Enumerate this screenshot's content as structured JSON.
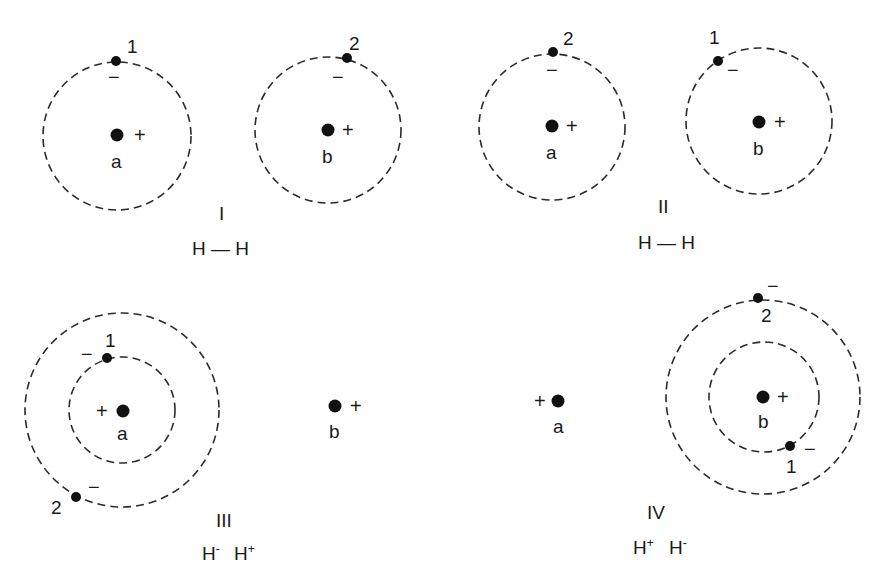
{
  "diagram": {
    "panels": [
      {
        "id": "I",
        "roman_label": "I",
        "formula": "H — H",
        "atoms": [
          {
            "label": "a",
            "charge": "+",
            "electron": {
              "number": "1",
              "charge": "−"
            }
          },
          {
            "label": "b",
            "charge": "+",
            "electron": {
              "number": "2",
              "charge": "−"
            }
          }
        ]
      },
      {
        "id": "II",
        "roman_label": "II",
        "formula": "H — H",
        "atoms": [
          {
            "label": "a",
            "charge": "+",
            "electron": {
              "number": "2",
              "charge": "−"
            }
          },
          {
            "label": "b",
            "charge": "+",
            "electron": {
              "number": "1",
              "charge": "−"
            }
          }
        ]
      },
      {
        "id": "III",
        "roman_label": "III",
        "formula_parts": [
          {
            "base": "H",
            "sup": "-"
          },
          {
            "base": "H",
            "sup": "+"
          }
        ],
        "atoms": [
          {
            "label": "a",
            "charge": "+",
            "electrons": [
              {
                "number": "1",
                "charge": "−"
              },
              {
                "number": "2",
                "charge": "−"
              }
            ]
          },
          {
            "label": "b",
            "charge": "+",
            "electrons": []
          }
        ]
      },
      {
        "id": "IV",
        "roman_label": "IV",
        "formula_parts": [
          {
            "base": "H",
            "sup": "+"
          },
          {
            "base": "H",
            "sup": "-"
          }
        ],
        "atoms": [
          {
            "label": "a",
            "charge": "+",
            "electrons": []
          },
          {
            "label": "b",
            "charge": "+",
            "electrons": [
              {
                "number": "1",
                "charge": "−"
              },
              {
                "number": "2",
                "charge": "−"
              }
            ]
          }
        ]
      }
    ],
    "symbols": {
      "plus": "+",
      "minus": "−",
      "minus_short": "–"
    }
  }
}
